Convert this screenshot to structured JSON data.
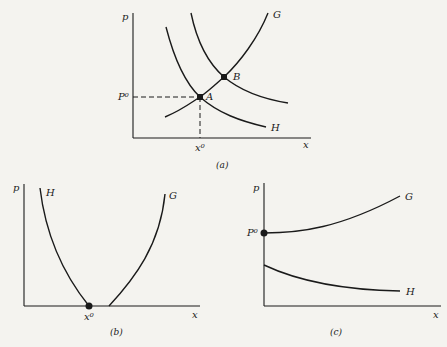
{
  "figure": {
    "panels": [
      {
        "id": "a",
        "caption": "(a)",
        "y_axis_label": "p",
        "x_axis_label": "x",
        "curves": [
          {
            "label": "G",
            "shape": "increasing convex"
          },
          {
            "label": "H",
            "shape": "decreasing convex"
          },
          {
            "label": "",
            "shape": "decreasing convex (shifted H)"
          }
        ],
        "points": [
          {
            "label": "A",
            "description": "intersection of G and H"
          },
          {
            "label": "B",
            "description": "intersection of G and shifted H"
          }
        ],
        "reference_labels": {
          "p0": "P⁰",
          "x0": "x⁰"
        }
      },
      {
        "id": "b",
        "caption": "(b)",
        "y_axis_label": "p",
        "x_axis_label": "x",
        "curves": [
          {
            "label": "H",
            "shape": "decreasing to x-axis at x⁰"
          },
          {
            "label": "G",
            "shape": "increasing from x-axis right of x⁰"
          }
        ],
        "reference_labels": {
          "x0": "x⁰"
        }
      },
      {
        "id": "c",
        "caption": "(c)",
        "y_axis_label": "p",
        "x_axis_label": "x",
        "curves": [
          {
            "label": "G",
            "shape": "increasing from P⁰"
          },
          {
            "label": "H",
            "shape": "decreasing, below G"
          }
        ],
        "reference_labels": {
          "p0": "P⁰"
        }
      }
    ]
  }
}
